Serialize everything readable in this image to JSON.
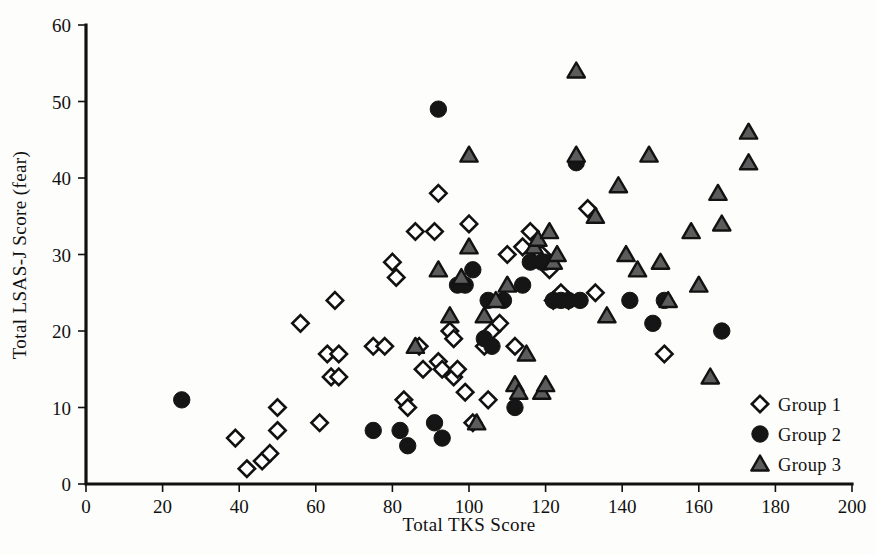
{
  "chart_data": {
    "type": "scatter",
    "title": "",
    "xlabel": "Total TKS Score",
    "ylabel": "Total LSAS-J Score (fear)",
    "xlim": [
      0,
      200
    ],
    "ylim": [
      0,
      60
    ],
    "xticks": [
      0,
      20,
      40,
      60,
      80,
      100,
      120,
      140,
      160,
      180,
      200
    ],
    "yticks": [
      0,
      10,
      20,
      30,
      40,
      50,
      60
    ],
    "xtick_labels": [
      "0",
      "20",
      "40",
      "60",
      "80",
      "100",
      "120",
      "140",
      "160",
      "180",
      "200"
    ],
    "ytick_labels": [
      "0",
      "10",
      "20",
      "30",
      "40",
      "50",
      "60"
    ],
    "grid": false,
    "legend_position": "bottom-right",
    "series": [
      {
        "name": "Group 1",
        "marker": "open-diamond",
        "color": "#ffffff",
        "edge_color": "#111111",
        "points": [
          [
            39,
            6
          ],
          [
            42,
            2
          ],
          [
            46,
            3
          ],
          [
            48,
            4
          ],
          [
            50,
            7
          ],
          [
            50,
            10
          ],
          [
            56,
            21
          ],
          [
            61,
            8
          ],
          [
            63,
            17
          ],
          [
            64,
            14
          ],
          [
            65,
            24
          ],
          [
            66,
            14
          ],
          [
            66,
            17
          ],
          [
            75,
            18
          ],
          [
            78,
            18
          ],
          [
            80,
            29
          ],
          [
            81,
            27
          ],
          [
            83,
            11
          ],
          [
            84,
            10
          ],
          [
            86,
            33
          ],
          [
            87,
            18
          ],
          [
            88,
            15
          ],
          [
            91,
            33
          ],
          [
            92,
            38
          ],
          [
            92,
            16
          ],
          [
            93,
            15
          ],
          [
            95,
            20
          ],
          [
            96,
            19
          ],
          [
            96,
            14
          ],
          [
            97,
            15
          ],
          [
            99,
            12
          ],
          [
            100,
            34
          ],
          [
            101,
            8
          ],
          [
            104,
            18
          ],
          [
            105,
            11
          ],
          [
            106,
            20
          ],
          [
            108,
            21
          ],
          [
            110,
            30
          ],
          [
            112,
            18
          ],
          [
            114,
            31
          ],
          [
            116,
            33
          ],
          [
            119,
            30
          ],
          [
            121,
            28
          ],
          [
            122,
            24
          ],
          [
            124,
            25
          ],
          [
            126,
            24
          ],
          [
            131,
            36
          ],
          [
            133,
            25
          ],
          [
            151,
            17
          ]
        ]
      },
      {
        "name": "Group 2",
        "marker": "filled-circle",
        "color": "#151515",
        "points": [
          [
            25,
            11
          ],
          [
            75,
            7
          ],
          [
            82,
            7
          ],
          [
            84,
            5
          ],
          [
            91,
            8
          ],
          [
            92,
            49
          ],
          [
            93,
            6
          ],
          [
            97,
            26
          ],
          [
            99,
            26
          ],
          [
            101,
            28
          ],
          [
            104,
            19
          ],
          [
            105,
            24
          ],
          [
            106,
            18
          ],
          [
            109,
            24
          ],
          [
            112,
            10
          ],
          [
            114,
            26
          ],
          [
            116,
            29
          ],
          [
            119,
            29
          ],
          [
            120,
            29
          ],
          [
            122,
            24
          ],
          [
            124,
            24
          ],
          [
            126,
            24
          ],
          [
            128,
            42
          ],
          [
            129,
            24
          ],
          [
            142,
            24
          ],
          [
            148,
            21
          ],
          [
            151,
            24
          ],
          [
            166,
            20
          ]
        ]
      },
      {
        "name": "Group 3",
        "marker": "filled-triangle",
        "color": "#5c5c5c",
        "edge_color": "#121212",
        "points": [
          [
            86,
            18
          ],
          [
            92,
            28
          ],
          [
            95,
            22
          ],
          [
            98,
            27
          ],
          [
            100,
            31
          ],
          [
            102,
            8
          ],
          [
            104,
            22
          ],
          [
            107,
            24
          ],
          [
            110,
            26
          ],
          [
            112,
            13
          ],
          [
            113,
            12
          ],
          [
            115,
            17
          ],
          [
            117,
            31
          ],
          [
            118,
            32
          ],
          [
            119,
            12
          ],
          [
            120,
            13
          ],
          [
            121,
            33
          ],
          [
            122,
            29
          ],
          [
            123,
            30
          ],
          [
            100,
            43
          ],
          [
            128,
            54
          ],
          [
            128,
            43
          ],
          [
            133,
            35
          ],
          [
            136,
            22
          ],
          [
            139,
            39
          ],
          [
            141,
            30
          ],
          [
            144,
            28
          ],
          [
            147,
            43
          ],
          [
            150,
            29
          ],
          [
            152,
            24
          ],
          [
            158,
            33
          ],
          [
            160,
            26
          ],
          [
            163,
            14
          ],
          [
            165,
            38
          ],
          [
            166,
            34
          ],
          [
            173,
            46
          ],
          [
            173,
            42
          ]
        ]
      }
    ]
  },
  "legend": {
    "entries": [
      {
        "label": "Group 1",
        "marker": "open-diamond"
      },
      {
        "label": "Group 2",
        "marker": "filled-circle"
      },
      {
        "label": "Group 3",
        "marker": "filled-triangle"
      }
    ]
  }
}
